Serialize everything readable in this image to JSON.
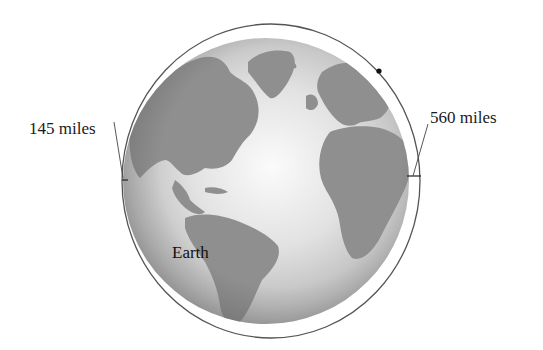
{
  "figure": {
    "labels": {
      "perigee": "145 miles",
      "apogee": "560 miles",
      "earth": "Earth"
    },
    "objects": {
      "earth": {
        "name": "Earth",
        "type": "globe"
      },
      "orbit": {
        "name": "satellite-orbit",
        "type": "ellipse"
      },
      "satellite": {
        "name": "satellite",
        "type": "dot"
      }
    },
    "colors": {
      "orbit_stroke": "#555555",
      "land": "#8e8e8e",
      "ocean_light": "#f2f2f2",
      "ocean_dark": "#9a9a9a",
      "text": "#1a1a1a"
    }
  }
}
